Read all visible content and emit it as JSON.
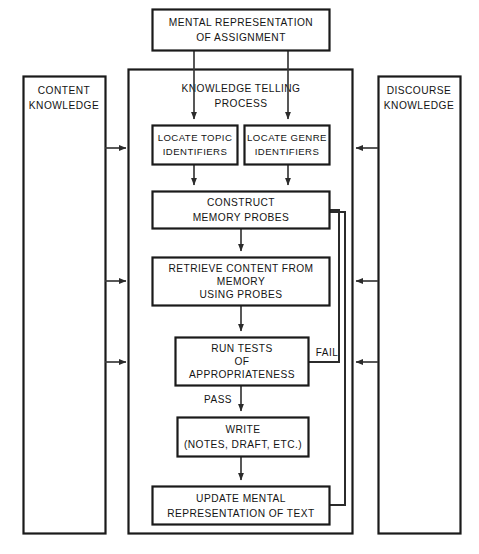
{
  "diagram": {
    "title": "Knowledge Telling Process",
    "type": "flowchart",
    "containers": [
      {
        "id": "content-knowledge",
        "label_lines": [
          "CONTENT",
          "KNOWLEDGE"
        ]
      },
      {
        "id": "discourse-knowledge",
        "label_lines": [
          "DISCOURSE",
          "KNOWLEDGE"
        ]
      },
      {
        "id": "knowledge-telling-process",
        "label_lines": [
          "KNOWLEDGE TELLING",
          "PROCESS"
        ]
      }
    ],
    "nodes": [
      {
        "id": "mental-representation",
        "label_lines": [
          "MENTAL REPRESENTATION",
          "OF ASSIGNMENT"
        ]
      },
      {
        "id": "locate-topic",
        "label_lines": [
          "LOCATE TOPIC",
          "IDENTIFIERS"
        ]
      },
      {
        "id": "locate-genre",
        "label_lines": [
          "LOCATE GENRE",
          "IDENTIFIERS"
        ]
      },
      {
        "id": "construct-memory-probes",
        "label_lines": [
          "CONSTRUCT",
          "MEMORY PROBES"
        ]
      },
      {
        "id": "retrieve-content",
        "label_lines": [
          "RETRIEVE CONTENT FROM",
          "MEMORY",
          "USING PROBES"
        ]
      },
      {
        "id": "run-tests",
        "label_lines": [
          "RUN  TESTS",
          "OF",
          "APPROPRIATENESS"
        ]
      },
      {
        "id": "write",
        "label_lines": [
          "WRITE",
          "(NOTES, DRAFT, ETC.)"
        ]
      },
      {
        "id": "update-mental-representation",
        "label_lines": [
          "UPDATE MENTAL",
          "REPRESENTATION OF TEXT"
        ]
      }
    ],
    "edge_labels": [
      {
        "id": "fail",
        "text": "FAIL"
      },
      {
        "id": "pass",
        "text": "PASS"
      }
    ],
    "colors": {
      "background": "#ffffff",
      "box_stroke": "#1a1a1a",
      "line_stroke": "#3a3a3a",
      "text": "#141414"
    }
  }
}
